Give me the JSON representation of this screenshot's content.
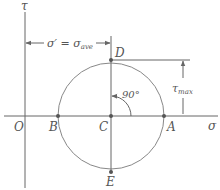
{
  "diagram": {
    "axes": {
      "horizontal_label": "σ",
      "vertical_label": "τ",
      "origin_label": "O"
    },
    "points": {
      "A": "A",
      "B": "B",
      "C": "C",
      "D": "D",
      "E": "E"
    },
    "annotations": {
      "sigma_prime": "σ′ = σ",
      "sigma_prime_sub": "ave",
      "tau_max": "τ",
      "tau_max_sub": "max",
      "angle": "90°"
    },
    "colors": {
      "line": "#666666",
      "circle": "#888888",
      "text": "#555555"
    }
  }
}
